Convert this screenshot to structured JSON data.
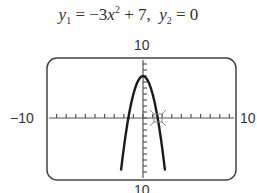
{
  "window": {
    "ymax_label": "10",
    "ymin_label": "10",
    "xmin_label": "−10",
    "xmax_label": "10"
  },
  "chart_data": {
    "type": "line",
    "series": [
      {
        "name": "y1",
        "expression": "-3x^2 + 7",
        "vertex": [
          0,
          7
        ],
        "x_intercepts": [
          -1.53,
          1.53
        ]
      },
      {
        "name": "y2",
        "expression": "0"
      }
    ],
    "xlim": [
      -10,
      10
    ],
    "ylim": [
      -10,
      10
    ],
    "x_tick_step": 1,
    "y_tick_step": 1,
    "cursor_point": [
      1.53,
      0
    ],
    "grid": false,
    "xlabel": "",
    "ylabel": ""
  }
}
